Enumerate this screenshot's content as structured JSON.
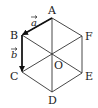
{
  "diagram": {
    "type": "regular hexagon with center and vectors",
    "vertices": [
      {
        "name": "A",
        "x": 52,
        "y": 18,
        "label_x": 48,
        "label_y": 14
      },
      {
        "name": "B",
        "x": 22,
        "y": 35,
        "label_x": 10,
        "label_y": 39
      },
      {
        "name": "C",
        "x": 22,
        "y": 72,
        "label_x": 10,
        "label_y": 80
      },
      {
        "name": "D",
        "x": 52,
        "y": 92,
        "label_x": 48,
        "label_y": 104
      },
      {
        "name": "E",
        "x": 82,
        "y": 73,
        "label_x": 85,
        "label_y": 80
      },
      {
        "name": "F",
        "x": 82,
        "y": 36,
        "label_x": 85,
        "label_y": 40
      }
    ],
    "center": {
      "name": "O",
      "x": 52,
      "y": 55,
      "label_x": 54,
      "label_y": 69
    },
    "vectors": [
      {
        "name": "a",
        "from": "A",
        "to": "B",
        "label": "a",
        "label_x": 31,
        "label_y": 26
      },
      {
        "name": "b",
        "from": "B",
        "to": "C",
        "label": "b",
        "label_x": 11,
        "label_y": 58
      }
    ],
    "diagonals": [
      "AD",
      "BE",
      "CF"
    ],
    "stroke_color": "#333333",
    "vector_color": "#111111"
  }
}
